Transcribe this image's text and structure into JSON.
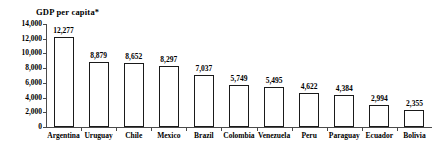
{
  "chart_data": {
    "type": "bar",
    "title": "GDP per capita*",
    "xlabel": "",
    "ylabel": "",
    "ylim": [
      0,
      14000
    ],
    "grid": false,
    "legend": false,
    "y_ticks": [
      "0",
      "2,000",
      "4,000",
      "6,000",
      "8,000",
      "10,000",
      "12,000",
      "14,000"
    ],
    "y_tick_values": [
      0,
      2000,
      4000,
      6000,
      8000,
      10000,
      12000,
      14000
    ],
    "categories": [
      "Argentina",
      "Uruguay",
      "Chile",
      "Mexico",
      "Brazil",
      "Colombia",
      "Venezuela",
      "Peru",
      "Paraguay",
      "Ecuador",
      "Bolivia"
    ],
    "values": [
      12277,
      8879,
      8652,
      8297,
      7037,
      5749,
      5495,
      4622,
      4384,
      2994,
      2355
    ],
    "value_labels": [
      "12,277",
      "8,879",
      "8,652",
      "8,297",
      "7,037",
      "5,749",
      "5,495",
      "4,622",
      "4,384",
      "2,994",
      "2,355"
    ],
    "bar_color": "#ffffff",
    "bar_edge_color": "#1a1a1a",
    "axis_color": "#4a4a4a",
    "background_color": "#ffffff"
  }
}
